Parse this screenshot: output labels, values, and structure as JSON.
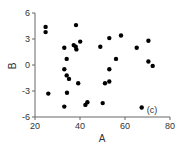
{
  "chart_data": {
    "type": "scatter",
    "title": "",
    "xlabel": "A",
    "ylabel": "B",
    "annotation": "(c)",
    "xlim": [
      20,
      80
    ],
    "ylim": [
      -6,
      6
    ],
    "xticks": [
      20,
      40,
      60,
      80
    ],
    "yticks": [
      6,
      3,
      0,
      -3,
      -6
    ],
    "xtick_labels": [
      "20",
      "40",
      "60",
      "80"
    ],
    "ytick_labels": [
      "6",
      "3",
      "0",
      "-3",
      "-6"
    ],
    "grid": false,
    "legend": null,
    "marker_color": "#000000",
    "series": [
      {
        "name": "data",
        "points": [
          {
            "x": 24.7,
            "y": 4.4
          },
          {
            "x": 24.7,
            "y": 3.8
          },
          {
            "x": 38.2,
            "y": 4.6
          },
          {
            "x": 25.9,
            "y": -3.3
          },
          {
            "x": 33.0,
            "y": 2.0
          },
          {
            "x": 37.2,
            "y": 2.3
          },
          {
            "x": 38.1,
            "y": 2.1
          },
          {
            "x": 38.4,
            "y": 1.8
          },
          {
            "x": 40.1,
            "y": 2.7
          },
          {
            "x": 34.1,
            "y": 0.7
          },
          {
            "x": 33.0,
            "y": -0.5
          },
          {
            "x": 34.1,
            "y": -1.2
          },
          {
            "x": 35.1,
            "y": -1.6
          },
          {
            "x": 39.2,
            "y": -2.1
          },
          {
            "x": 34.2,
            "y": -3.2
          },
          {
            "x": 33.0,
            "y": -4.8
          },
          {
            "x": 42.4,
            "y": -4.6
          },
          {
            "x": 43.3,
            "y": -4.3
          },
          {
            "x": 50.1,
            "y": -4.4
          },
          {
            "x": 49.0,
            "y": 2.1
          },
          {
            "x": 53.0,
            "y": 3.1
          },
          {
            "x": 58.2,
            "y": 3.4
          },
          {
            "x": 56.0,
            "y": 0.7
          },
          {
            "x": 53.0,
            "y": -0.5
          },
          {
            "x": 51.1,
            "y": -2.1
          },
          {
            "x": 53.0,
            "y": -1.9
          },
          {
            "x": 65.2,
            "y": 2.0
          },
          {
            "x": 70.4,
            "y": 2.8
          },
          {
            "x": 70.4,
            "y": 0.4
          },
          {
            "x": 72.3,
            "y": -0.1
          },
          {
            "x": 67.4,
            "y": -4.9
          }
        ]
      }
    ]
  }
}
